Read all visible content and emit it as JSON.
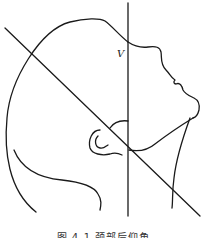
{
  "figure": {
    "label_v": "V",
    "caption": "图 4-1 颈部后仰角"
  },
  "drawing": {
    "subject": "head-profile-tilted-back",
    "lines": [
      {
        "name": "vertical-reference-line",
        "x1": 128,
        "y1": 3,
        "x2": 128,
        "y2": 216
      },
      {
        "name": "diagonal-reference-line",
        "x1": 5,
        "y1": 28,
        "x2": 200,
        "y2": 216
      }
    ],
    "stroke_color": "#1a1a1a",
    "background": "#ffffff"
  }
}
